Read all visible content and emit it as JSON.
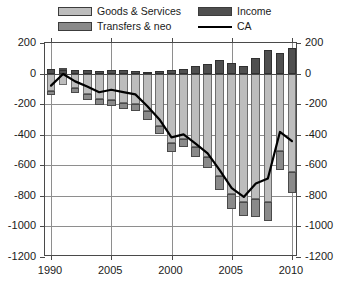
{
  "legend": {
    "items": [
      {
        "label": "Goods & Services",
        "color": "#bdbdbd",
        "kind": "swatch",
        "icon": "legend-swatch-icon"
      },
      {
        "label": "Transfers & neo",
        "color": "#8a8a8a",
        "kind": "swatch",
        "icon": "legend-swatch-icon"
      },
      {
        "label": "Income",
        "color": "#4f4f4f",
        "kind": "swatch",
        "icon": "legend-swatch-icon"
      },
      {
        "label": "CA",
        "color": "#000000",
        "kind": "line",
        "icon": "legend-line-icon"
      }
    ]
  },
  "axes": {
    "y_ticks": [
      "200",
      "0",
      "-200",
      "-400",
      "-600",
      "-800",
      "-1000",
      "-1200"
    ],
    "y_ticks_right": [
      "200",
      "0",
      "-200",
      "-400",
      "-600",
      "-800",
      "-1000",
      "-1200"
    ],
    "x_ticks": [
      "1990",
      "2005",
      "2000",
      "2005",
      "2010"
    ]
  },
  "chart_data": {
    "type": "bar",
    "title": "",
    "subtitle": "",
    "xlabel": "",
    "ylabel": "",
    "ylim": [
      -1200,
      200
    ],
    "ytick_step": 200,
    "grid": true,
    "legend_position": "top",
    "stacked": true,
    "overlay_line": true,
    "categories": [
      "1990",
      "1991",
      "1992",
      "1993",
      "1994",
      "1995",
      "1996",
      "1997",
      "1998",
      "1999",
      "2000",
      "2001",
      "2002",
      "2003",
      "2004",
      "2005",
      "2006",
      "2007",
      "2008",
      "2009",
      "2010"
    ],
    "x_tick_labels": [
      "1990",
      "2005",
      "2000",
      "2005",
      "2010"
    ],
    "x_tick_categories": [
      "1990",
      "1995",
      "2000",
      "2005",
      "2010"
    ],
    "series": [
      {
        "name": "Goods & Services",
        "color": "#bdbdbd",
        "values": [
          -111,
          -77,
          -97,
          -133,
          -166,
          -175,
          -191,
          -198,
          -247,
          -346,
          -452,
          -429,
          -482,
          -549,
          -671,
          -791,
          -838,
          -823,
          -840,
          -507,
          -647
        ]
      },
      {
        "name": "Income",
        "color": "#4f4f4f",
        "values": [
          29,
          25,
          25,
          26,
          18,
          21,
          23,
          16,
          10,
          14,
          22,
          30,
          49,
          64,
          92,
          70,
          52,
          105,
          152,
          132,
          168
        ]
      },
      {
        "name": "Transfers & neo",
        "color": "#8a8a8a",
        "values": [
          -26,
          9,
          -33,
          -37,
          -40,
          -38,
          -43,
          -45,
          -54,
          -49,
          -59,
          -52,
          -64,
          -72,
          -88,
          -98,
          -92,
          -116,
          -123,
          -125,
          -136
        ]
      }
    ],
    "line_series": {
      "name": "CA",
      "color": "#000000",
      "values": [
        -79,
        -3,
        -51,
        -85,
        -122,
        -106,
        -121,
        -136,
        -214,
        -300,
        -417,
        -398,
        -459,
        -522,
        -632,
        -749,
        -807,
        -719,
        -687,
        -382,
        -442
      ]
    }
  }
}
